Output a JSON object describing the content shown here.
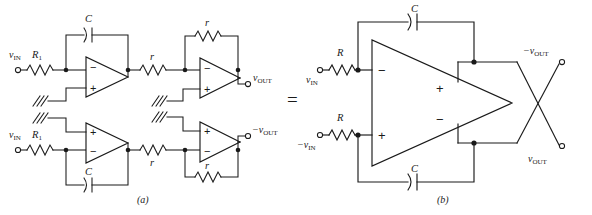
{
  "figure": {
    "equals_sign": "=",
    "panel_a": {
      "caption": "(a)",
      "input_top_label": "v",
      "input_top_sub": "IN",
      "input_bottom_label": "v",
      "input_bottom_sub": "IN",
      "resistor_in_top": "R",
      "resistor_in_top_sub": "1",
      "resistor_in_bottom": "R",
      "resistor_in_bottom_sub": "1",
      "cap_top": "C",
      "cap_bottom": "C",
      "r_series_top": "r",
      "r_series_bottom": "r",
      "r_feedback_top": "r",
      "r_feedback_bottom": "r",
      "output_top_sign": "",
      "output_top_label": "v",
      "output_top_sub": "OUT",
      "output_bottom_sign": "−",
      "output_bottom_label": "v",
      "output_bottom_sub": "OUT",
      "opamp1_minus": "−",
      "opamp1_plus": "+",
      "opamp2_minus": "−",
      "opamp2_plus": "+",
      "opamp3_minus": "−",
      "opamp3_plus": "+",
      "opamp4_minus": "−",
      "opamp4_plus": "+"
    },
    "panel_b": {
      "caption": "(b)",
      "cap_top": "C",
      "cap_bottom": "C",
      "resistor_top": "R",
      "resistor_bottom": "R",
      "input_top_label": "v",
      "input_top_sub": "IN",
      "input_bottom_sign": "−",
      "input_bottom_label": "v",
      "input_bottom_sub": "IN",
      "amp_in_minus": "−",
      "amp_in_plus": "+",
      "amp_out_plus": "+",
      "amp_out_minus": "−",
      "output_top_sign": "−",
      "output_top_label": "v",
      "output_top_sub": "OUT",
      "output_bottom_label": "v",
      "output_bottom_sub": "OUT"
    },
    "colors": {
      "ink": "#1a1a1a",
      "background": "#ffffff"
    }
  }
}
